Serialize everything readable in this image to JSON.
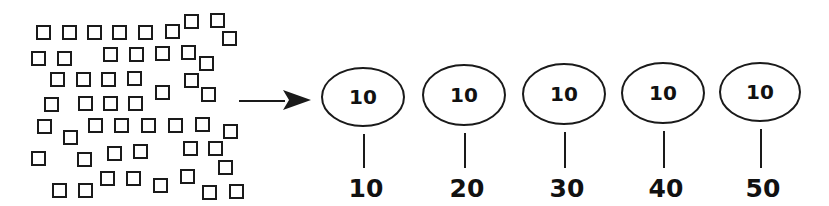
{
  "diagram": {
    "colors": {
      "stroke": "#1a1a1a",
      "text": "#111111",
      "background": "#ffffff"
    },
    "square_size": 13,
    "squares": [
      [
        37,
        26
      ],
      [
        63,
        26
      ],
      [
        88,
        26
      ],
      [
        113,
        26
      ],
      [
        139,
        26
      ],
      [
        166,
        25
      ],
      [
        185,
        15
      ],
      [
        211,
        14
      ],
      [
        223,
        32
      ],
      [
        32,
        52
      ],
      [
        58,
        52
      ],
      [
        104,
        48
      ],
      [
        130,
        48
      ],
      [
        156,
        47
      ],
      [
        182,
        46
      ],
      [
        200,
        57
      ],
      [
        51,
        73
      ],
      [
        77,
        73
      ],
      [
        102,
        73
      ],
      [
        128,
        72
      ],
      [
        156,
        86
      ],
      [
        185,
        74
      ],
      [
        202,
        88
      ],
      [
        45,
        98
      ],
      [
        79,
        97
      ],
      [
        104,
        97
      ],
      [
        129,
        97
      ],
      [
        38,
        120
      ],
      [
        64,
        131
      ],
      [
        89,
        119
      ],
      [
        115,
        119
      ],
      [
        142,
        119
      ],
      [
        169,
        119
      ],
      [
        196,
        118
      ],
      [
        224,
        125
      ],
      [
        32,
        152
      ],
      [
        78,
        153
      ],
      [
        108,
        147
      ],
      [
        134,
        145
      ],
      [
        184,
        142
      ],
      [
        209,
        142
      ],
      [
        219,
        161
      ],
      [
        53,
        184
      ],
      [
        79,
        184
      ],
      [
        101,
        172
      ],
      [
        127,
        172
      ],
      [
        154,
        179
      ],
      [
        181,
        170
      ],
      [
        203,
        186
      ],
      [
        230,
        185
      ]
    ],
    "arrow": {
      "x1": 239,
      "y1": 101,
      "x2": 311,
      "y2": 100
    },
    "groups": [
      {
        "cx": 363,
        "cy": 97,
        "rx": 41,
        "ry": 29,
        "inner": "10",
        "total": "10"
      },
      {
        "cx": 464,
        "cy": 95,
        "rx": 41,
        "ry": 30,
        "inner": "10",
        "total": "20"
      },
      {
        "cx": 564,
        "cy": 94,
        "rx": 41,
        "ry": 30,
        "inner": "10",
        "total": "30"
      },
      {
        "cx": 663,
        "cy": 93,
        "rx": 41,
        "ry": 30,
        "inner": "10",
        "total": "40"
      },
      {
        "cx": 760,
        "cy": 92,
        "rx": 40,
        "ry": 29,
        "inner": "10",
        "total": "50"
      }
    ]
  }
}
